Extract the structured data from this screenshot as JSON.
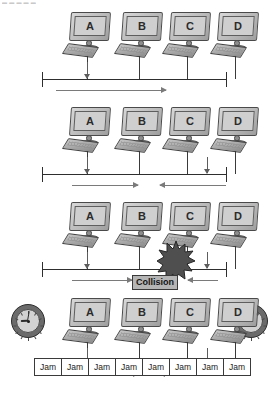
{
  "header": {
    "clipped_text": "▬ ▬ ▬ ▬ ▬"
  },
  "diagram": {
    "stations": [
      "A",
      "B",
      "C",
      "D"
    ],
    "colors": {
      "monitor_body": "#b9b9b9",
      "monitor_screen": "#cfcfcf",
      "outline": "#3a3a3a",
      "bus_line": "#2e2e2e",
      "signal_arrow": "#7a7a7a",
      "transmit_arrow": "#5d5d5d",
      "collision_box": "#b5b5b5",
      "burst_fill": "#4f4f4f",
      "clock_bezel": "#6b6b6b",
      "clock_face": "#d2d2d2",
      "background": "#ffffff"
    },
    "panels": [
      {
        "index": 1,
        "caption": "Station A begins transmitting; signal propagates to the right",
        "stations": [
          "A",
          "B",
          "C",
          "D"
        ],
        "transmitting": [
          "A"
        ],
        "signals": [
          {
            "from": "A",
            "direction": "right"
          }
        ],
        "collision": false,
        "jam": false,
        "clocks": []
      },
      {
        "index": 2,
        "caption": "Stations A and D both transmit; signals travel toward each other",
        "stations": [
          "A",
          "B",
          "C",
          "D"
        ],
        "transmitting": [
          "A",
          "D"
        ],
        "signals": [
          {
            "from": "A",
            "direction": "right"
          },
          {
            "from": "D",
            "direction": "left"
          }
        ],
        "collision": false,
        "jam": false,
        "clocks": []
      },
      {
        "index": 3,
        "caption": "The two signals meet and a collision occurs between B and C",
        "stations": [
          "A",
          "B",
          "C",
          "D"
        ],
        "transmitting": [
          "A",
          "D"
        ],
        "signals": [
          {
            "from": "A",
            "direction": "right"
          },
          {
            "from": "D",
            "direction": "left"
          }
        ],
        "collision": true,
        "collision_label": "Collision",
        "burst": true,
        "jam": false,
        "clocks": []
      },
      {
        "index": 4,
        "caption": "Both stations detect the collision and send a jam signal",
        "stations": [
          "A",
          "B",
          "C",
          "D"
        ],
        "transmitting": [
          "A",
          "D"
        ],
        "signals": [
          {
            "from": "A",
            "direction": "right"
          },
          {
            "from": "D",
            "direction": "left"
          }
        ],
        "collision": false,
        "jam": true,
        "jam_label": "Jam",
        "jam_count": 8,
        "jam_cells": [
          "Jam",
          "Jam",
          "Jam",
          "Jam",
          "Jam",
          "Jam",
          "Jam",
          "Jam"
        ],
        "clocks": [
          {
            "position": "left",
            "hour_angle": 268,
            "minute_angle": 10
          },
          {
            "position": "right",
            "hour_angle": 325,
            "minute_angle": 35
          }
        ]
      }
    ]
  }
}
